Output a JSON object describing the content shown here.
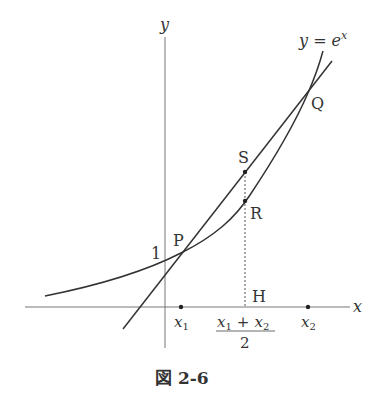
{
  "figure": {
    "caption": "図 2-6",
    "axis_labels": {
      "x": "x",
      "y": "y"
    },
    "curve_label": "y = e^x",
    "curve_label_base": "y = e",
    "curve_label_exp": "x",
    "y_intercept_label": "1",
    "points": {
      "P": "P",
      "Q": "Q",
      "R": "R",
      "S": "S",
      "H": "H"
    },
    "tick_labels": {
      "x1": "x",
      "x1_sub": "1",
      "x2": "x",
      "x2_sub": "2",
      "mid_numerator_a": "x",
      "mid_numerator_a_sub": "1",
      "mid_plus": "+",
      "mid_numerator_b": "x",
      "mid_numerator_b_sub": "2",
      "mid_denominator": "2"
    },
    "colors": {
      "stroke": "#333333",
      "axis": "#666666"
    }
  }
}
